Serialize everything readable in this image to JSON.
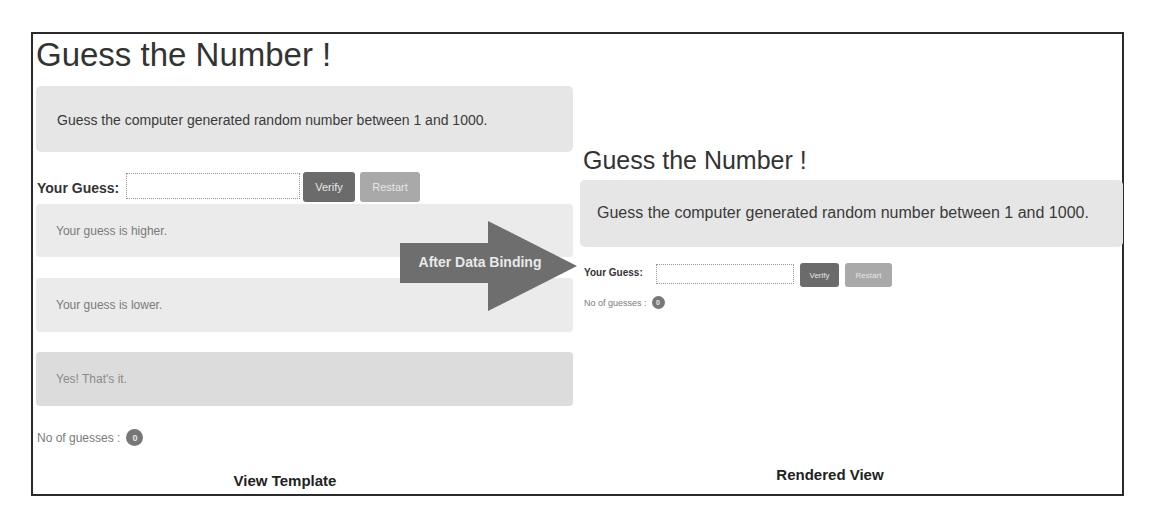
{
  "colors": {
    "frame_border": "#2a2a2a",
    "jumbotron_bg": "#e6e6e6",
    "alert_bg": "#ebebeb",
    "alert_success_bg": "#dcdcdc",
    "verify_button": "#6b6b6b",
    "restart_button": "#a9a9a9",
    "badge": "#777777",
    "arrow": "#6e6e6e"
  },
  "view_template": {
    "title": "Guess the Number !",
    "instructions": "Guess the computer generated random number between 1 and 1000.",
    "guess_label": "Your Guess:",
    "guess_input_value": "",
    "verify_label": "Verify",
    "restart_label": "Restart",
    "alerts": [
      {
        "text": "Your guess is higher.",
        "type": "info"
      },
      {
        "text": "Your guess is lower.",
        "type": "info"
      },
      {
        "text": "Yes! That's it.",
        "type": "success"
      }
    ],
    "guesses_label": "No of guesses :",
    "guesses_count": "0",
    "caption": "View Template"
  },
  "arrow": {
    "label": "After Data Binding",
    "icon": "right-arrow-icon"
  },
  "rendered_view": {
    "title": "Guess the Number !",
    "instructions": "Guess the computer generated random number between 1 and 1000.",
    "guess_label": "Your Guess:",
    "guess_input_value": "",
    "verify_label": "Verify",
    "restart_label": "Restart",
    "guesses_label": "No of guesses :",
    "guesses_count": "0",
    "caption": "Rendered View"
  }
}
